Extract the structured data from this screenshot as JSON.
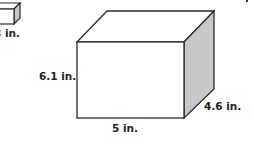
{
  "figure": {
    "type": "rectangular prism diagram",
    "colors": {
      "background": "#ffffff",
      "edge": "#2a2a2a",
      "front_face": "#ffffff",
      "top_face": "#ffffff",
      "side_face": "#c8c8c8"
    },
    "large_prism": {
      "height_label": "6.1 in.",
      "width_label": "5 in.",
      "depth_label": "4.6 in."
    },
    "small_prism_partial": {
      "label": "3 in."
    }
  }
}
